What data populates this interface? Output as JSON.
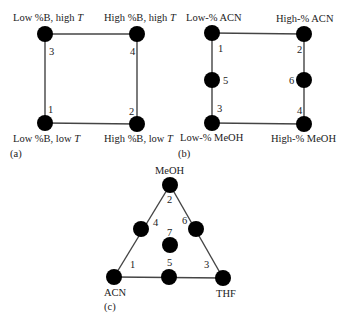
{
  "panels": {
    "a": {
      "caption": "(a)",
      "corner_labels": {
        "top_left": "Low %B, high ",
        "top_right": "High %B, high ",
        "bottom_left": "Low %B, low ",
        "bottom_right": "High %B, low ",
        "T": "T"
      },
      "node_numbers": [
        "1",
        "2",
        "3",
        "4"
      ]
    },
    "b": {
      "caption": "(b)",
      "corner_labels": {
        "top_left": "Low-% ACN",
        "top_right": "High-% ACN",
        "bottom_left": "Low-% MeOH",
        "bottom_right": "High-% MeOH"
      },
      "node_numbers": [
        "1",
        "2",
        "3",
        "4",
        "5",
        "6"
      ]
    },
    "c": {
      "caption": "(c)",
      "vertex_labels": {
        "top": "MeOH",
        "bottom_left": "ACN",
        "bottom_right": "THF"
      },
      "node_numbers": [
        "1",
        "2",
        "3",
        "4",
        "5",
        "6",
        "7"
      ]
    }
  },
  "colors": {
    "node": "#000000",
    "edge": "#444444",
    "text": "#222222"
  }
}
